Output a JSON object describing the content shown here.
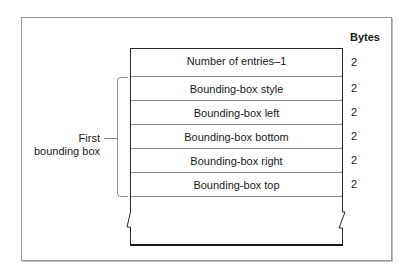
{
  "diagram": {
    "column_header": "Bytes",
    "rows": [
      {
        "label": "Number of entries–1",
        "bytes": "2"
      },
      {
        "label": "Bounding-box style",
        "bytes": "2"
      },
      {
        "label": "Bounding-box left",
        "bytes": "2"
      },
      {
        "label": "Bounding-box bottom",
        "bytes": "2"
      },
      {
        "label": "Bounding-box right",
        "bytes": "2"
      },
      {
        "label": "Bounding-box top",
        "bytes": "2"
      }
    ],
    "bracket_label_line1": "First",
    "bracket_label_line2": "bounding box"
  }
}
